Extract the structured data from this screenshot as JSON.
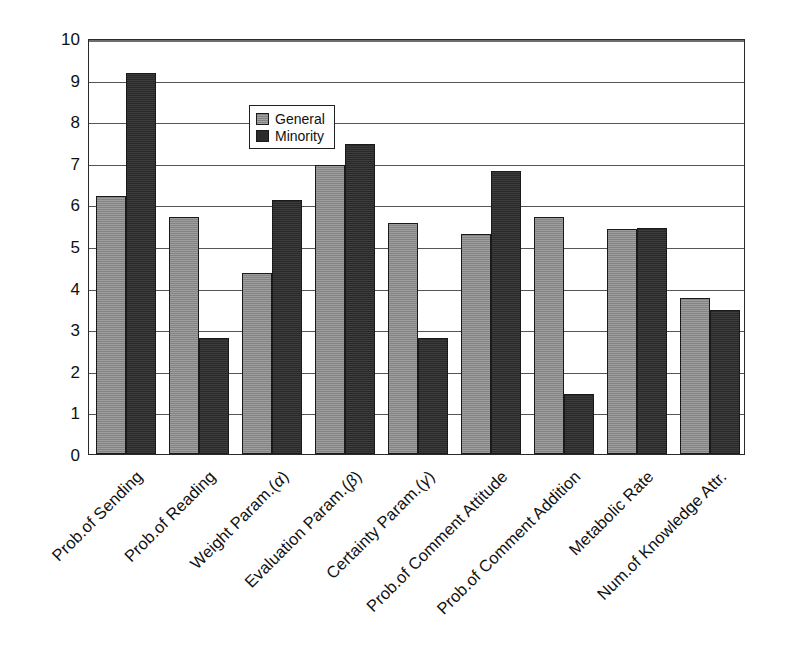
{
  "chart_data": {
    "type": "bar",
    "title": "",
    "subtitle": "",
    "xlabel": "",
    "ylabel": "",
    "ylim": [
      0,
      10
    ],
    "ytick_labels": [
      "10",
      "9",
      "8",
      "7",
      "6",
      "5",
      "4",
      "3",
      "2",
      "1",
      "0"
    ],
    "yticks": [
      10,
      9,
      8,
      7,
      6,
      5,
      4,
      3,
      2,
      1,
      0
    ],
    "grid": true,
    "legend_position": "inside-top-center",
    "categories": [
      "Prob.of Sending",
      "Prob.of Reading",
      "Weight Param.(α)",
      "Evaluation Param.(β)",
      "Certainty Param.(γ)",
      "Prob.of Comment Attitude",
      "Prob.of Comment Addition",
      "Metabolic Rate",
      "Num.of Knowledge Attr."
    ],
    "series": [
      {
        "name": "General",
        "color": "#8c8c8c",
        "values": [
          6.2,
          5.7,
          4.35,
          6.95,
          5.55,
          5.3,
          5.7,
          5.4,
          3.75
        ]
      },
      {
        "name": "Minority",
        "color": "#2e2e2e",
        "values": [
          9.15,
          2.8,
          6.1,
          7.45,
          2.8,
          6.8,
          1.45,
          5.43,
          3.45
        ]
      }
    ]
  },
  "legend": {
    "entries": [
      {
        "label": "General",
        "swatch": "general-swatch"
      },
      {
        "label": "Minority",
        "swatch": "minority-swatch"
      }
    ]
  },
  "colors": {
    "general": "#8c8c8c",
    "minority": "#2e2e2e",
    "axis": "#2a2a2a",
    "grid": "#555555",
    "background": "#ffffff",
    "text": "#111111"
  }
}
